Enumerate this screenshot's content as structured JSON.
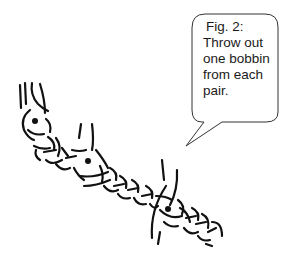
{
  "figure": {
    "label": "Fig. 2:",
    "caption_lines": [
      "Throw out",
      "one bobbin",
      "from each",
      "pair."
    ]
  },
  "diagram": {
    "ink_color": "#111111",
    "bubble_stroke": "#333333",
    "marked_points": 3
  }
}
